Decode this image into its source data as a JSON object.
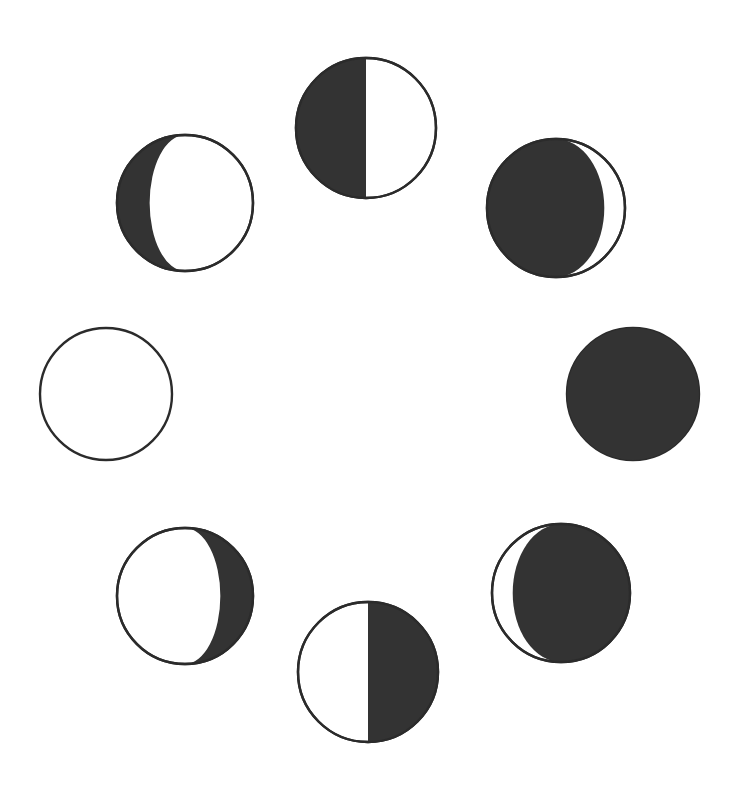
{
  "figure": {
    "kind": "moon-phase-ring-diagram",
    "width": 740,
    "height": 790,
    "background_color": "#FFFFFF",
    "outline_color": "#2B2B2B",
    "shadow_color": "#333333",
    "outline_width": 2.4,
    "disc_count": 8,
    "ring_center": [
      371,
      396
    ],
    "ring_radius_x": 266,
    "ring_radius_y": 272
  },
  "chart_data": {
    "type": "scatter",
    "xlabel": "",
    "ylabel": "",
    "legend_position": "none",
    "grid": false,
    "xlim": [
      0,
      740
    ],
    "ylim": [
      0,
      790
    ],
    "categories": [
      "full-moon",
      "waning-gibbous",
      "last-quarter",
      "waning-crescent",
      "new-moon",
      "waxing-crescent",
      "first-quarter",
      "waxing-gibbous"
    ],
    "values": [
      100,
      78,
      50,
      12,
      0,
      12,
      50,
      78
    ],
    "series": [
      {
        "name": "illuminated_fraction_percent",
        "values": [
          100,
          78,
          50,
          12,
          0,
          12,
          50,
          78
        ]
      },
      {
        "name": "dark_fraction_percent",
        "values": [
          0,
          22,
          50,
          88,
          100,
          88,
          50,
          22
        ]
      }
    ]
  },
  "discs": [
    {
      "id": "disc-left",
      "name": "full-moon",
      "label": "Full Moon",
      "ring_position": "left",
      "clock_position": "9 o'clock",
      "cx": 106,
      "cy": 394,
      "r": 66,
      "lit_side": "all",
      "dark_side": "none",
      "terminator_curvature": 0,
      "illuminated_fraction_percent": 100,
      "fill": "none"
    },
    {
      "id": "disc-lower-left",
      "name": "waning-gibbous",
      "label": "Waning Gibbous",
      "ring_position": "lower-left",
      "clock_position": "7 o'clock",
      "cx": 185,
      "cy": 596,
      "r": 68,
      "lit_side": "left",
      "dark_side": "right",
      "terminator_curvature": -0.52,
      "illuminated_fraction_percent": 74,
      "fill": "partial"
    },
    {
      "id": "disc-bottom",
      "name": "last-quarter",
      "label": "Last Quarter",
      "ring_position": "bottom",
      "clock_position": "6 o'clock",
      "cx": 368,
      "cy": 672,
      "r": 70,
      "lit_side": "left",
      "dark_side": "right",
      "terminator_curvature": 0,
      "illuminated_fraction_percent": 50,
      "fill": "half"
    },
    {
      "id": "disc-lower-right",
      "name": "waning-crescent",
      "label": "Waning Crescent",
      "ring_position": "lower-right",
      "clock_position": "4-5 o'clock",
      "cx": 561,
      "cy": 593,
      "r": 69,
      "lit_side": "left",
      "dark_side": "right",
      "terminator_curvature": 0.7,
      "illuminated_fraction_percent": 14,
      "fill": "partial"
    },
    {
      "id": "disc-right",
      "name": "new-moon",
      "label": "New Moon",
      "ring_position": "right",
      "clock_position": "3 o'clock",
      "cx": 633,
      "cy": 394,
      "r": 66,
      "lit_side": "none",
      "dark_side": "all",
      "terminator_curvature": 0,
      "illuminated_fraction_percent": 0,
      "fill": "full"
    },
    {
      "id": "disc-upper-right",
      "name": "waxing-crescent",
      "label": "Waxing Crescent",
      "ring_position": "upper-right",
      "clock_position": "1-2 o'clock",
      "cx": 556,
      "cy": 208,
      "r": 69,
      "lit_side": "right",
      "dark_side": "left",
      "terminator_curvature": 0.7,
      "illuminated_fraction_percent": 14,
      "fill": "partial"
    },
    {
      "id": "disc-top",
      "name": "first-quarter",
      "label": "First Quarter",
      "ring_position": "top",
      "clock_position": "12 o'clock",
      "cx": 366,
      "cy": 128,
      "r": 70,
      "lit_side": "right",
      "dark_side": "left",
      "terminator_curvature": 0,
      "illuminated_fraction_percent": 50,
      "fill": "half"
    },
    {
      "id": "disc-upper-left",
      "name": "waxing-gibbous",
      "label": "Waxing Gibbous",
      "ring_position": "upper-left",
      "clock_position": "10-11 o'clock",
      "cx": 185,
      "cy": 203,
      "r": 68,
      "lit_side": "right",
      "dark_side": "left",
      "terminator_curvature": -0.52,
      "illuminated_fraction_percent": 74,
      "fill": "partial"
    }
  ]
}
